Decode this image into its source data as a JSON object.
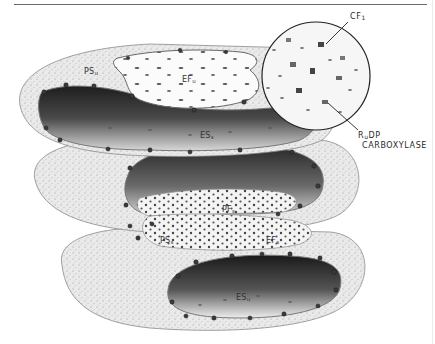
{
  "figure": {
    "top_rule": true,
    "colors": {
      "background": "#ffffff",
      "stroma_fill": "#e6e6e6",
      "dark_lumen": "#2b2b2b",
      "fracture_face_light": "#f7f7f7",
      "particle": "#3a3a3a",
      "rule": "#6a6a6a"
    }
  },
  "labels": {
    "ps_u": {
      "main": "PS",
      "sub": "u"
    },
    "ef_u": {
      "main": "EF",
      "sub": "u"
    },
    "es_s": {
      "main": "ES",
      "sub": "s"
    },
    "pf_s": {
      "main": "PF",
      "sub": "s"
    },
    "ps_s": {
      "main": "PS",
      "sub": "s"
    },
    "ef_s": {
      "main": "EF",
      "sub": "s"
    },
    "es_u": {
      "main": "ES",
      "sub": "u"
    }
  },
  "callouts": {
    "cf1": {
      "main": "CF",
      "sub": "1"
    },
    "rudp": {
      "line1_main": "R",
      "line1_sub": "u",
      "line1_rest": "DP",
      "line2": "CARBOXYLASE"
    }
  },
  "inset": {
    "shape": "circle",
    "description": "magnified membrane surface showing particles"
  }
}
